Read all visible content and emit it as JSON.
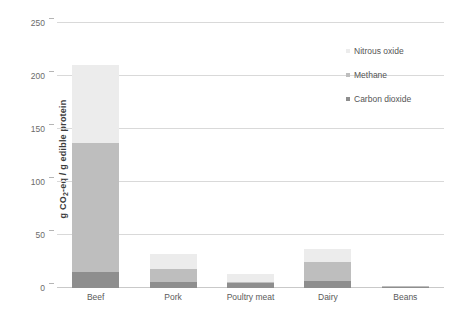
{
  "chart_data": {
    "type": "bar",
    "subtype": "stacked-bar",
    "title": "",
    "xlabel": "",
    "ylabel": "g CO2-eq / g edible protein",
    "ylabel_parts": {
      "prefix": "g CO",
      "sub": "2",
      "suffix": "-eq / g edible protein"
    },
    "categories": [
      "Beef",
      "Pork",
      "Poultry meat",
      "Dairy",
      "Beans"
    ],
    "series": [
      {
        "name": "Carbon dioxide",
        "color": "#8e8e8e",
        "values": [
          15,
          6,
          5,
          7,
          1
        ]
      },
      {
        "name": "Methane",
        "color": "#bebebe",
        "values": [
          122,
          12,
          1,
          18,
          0.2
        ]
      },
      {
        "name": "Nitrous oxide",
        "color": "#ececec",
        "values": [
          73,
          14,
          7,
          12,
          0.3
        ]
      }
    ],
    "stack_order_bottom_to_top": [
      "Carbon dioxide",
      "Methane",
      "Nitrous oxide"
    ],
    "totals": [
      210,
      32,
      13,
      37,
      1.5
    ],
    "ylim": [
      0,
      250
    ],
    "yticks": [
      0,
      50,
      100,
      150,
      200,
      250
    ],
    "ytick_labels": [
      "0",
      "50",
      "100",
      "150",
      "200",
      "250"
    ],
    "grid": true,
    "grid_axis": "y",
    "legend_position": "right-top",
    "legend": [
      {
        "label": "Nitrous oxide",
        "color": "#ececec"
      },
      {
        "label": "Methane",
        "color": "#bebebe"
      },
      {
        "label": "Carbon dioxide",
        "color": "#8e8e8e"
      }
    ],
    "background": "#ffffff",
    "gridline_color": "#d9d9d9",
    "axis_color": "#c9c9c9"
  }
}
